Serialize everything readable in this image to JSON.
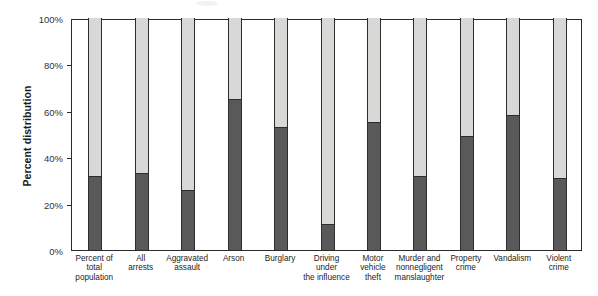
{
  "chart_data": {
    "type": "bar",
    "stacked": true,
    "title": "",
    "xlabel": "",
    "ylabel": "Percent distribution",
    "ylim": [
      0,
      100
    ],
    "ytick_labels": [
      "0%",
      "20%",
      "40%",
      "60%",
      "80%",
      "100%"
    ],
    "ytick_values": [
      0,
      20,
      40,
      60,
      80,
      100
    ],
    "grid": false,
    "legend": "none",
    "categories": [
      "Percent of\ntotal\npopulation",
      "All\narrests",
      "Aggravated\nassault",
      "Arson",
      "Burglary",
      "Driving\nunder\nthe influence",
      "Motor\nvehicle\ntheft",
      "Murder and\nnonnegligent\nmanslaughter",
      "Property\ncrime",
      "Vandalism",
      "Violent\ncrime"
    ],
    "series": [
      {
        "name": "lower-segment",
        "color": "#595959",
        "values": [
          32,
          33,
          26,
          65,
          53,
          11,
          55,
          32,
          49,
          58,
          31
        ]
      },
      {
        "name": "upper-segment",
        "color": "#d8d8d6",
        "values": [
          68,
          67,
          74,
          35,
          47,
          89,
          45,
          68,
          51,
          42,
          69
        ]
      }
    ]
  },
  "colors": {
    "lower_segment": "#595959",
    "upper_segment": "#d8d8d6",
    "axis": "#2b2b2b",
    "text": "#1d1d1d",
    "background": "#ffffff"
  }
}
